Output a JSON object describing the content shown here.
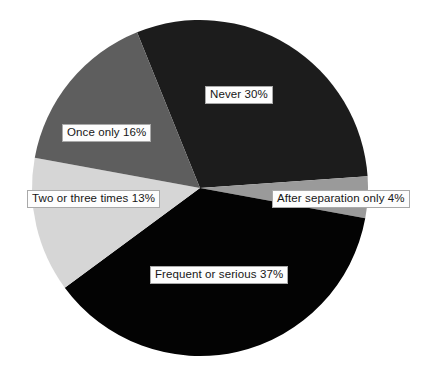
{
  "chart_data": {
    "type": "pie",
    "title": "",
    "subtitle": "",
    "xlabel": "",
    "ylabel": "",
    "legend_position": "none",
    "grid": false,
    "value_unit": "percent",
    "total": 100,
    "start_angle_deg": -22,
    "direction": "clockwise",
    "categories": [
      "Never",
      "After separation only",
      "Frequent or serious",
      "Two or three times",
      "Once only"
    ],
    "values": [
      30,
      4,
      37,
      13,
      16
    ],
    "labels": [
      "Never 30%",
      "After separation only 4%",
      "Frequent or serious 37%",
      "Two or three times 13%",
      "Once only 16%"
    ],
    "colors": [
      "#1c1c1c",
      "#9a9a9a",
      "#030303",
      "#d6d6d6",
      "#5e5e5e"
    ],
    "slices": [
      {
        "name": "Never",
        "label": "Never 30%",
        "value": 30,
        "color": "#1c1c1c",
        "start_deg": -22,
        "end_deg": 86
      },
      {
        "name": "After separation only",
        "label": "After separation only 4%",
        "value": 4,
        "color": "#9a9a9a",
        "start_deg": 86,
        "end_deg": 100.4
      },
      {
        "name": "Frequent or serious",
        "label": "Frequent or serious 37%",
        "value": 37,
        "color": "#030303",
        "start_deg": 100.4,
        "end_deg": 233.6
      },
      {
        "name": "Two or three times",
        "label": "Two or three times 13%",
        "value": 13,
        "color": "#d6d6d6",
        "start_deg": 233.6,
        "end_deg": 280.4
      },
      {
        "name": "Once only",
        "label": "Once only 16%",
        "value": 16,
        "color": "#5e5e5e",
        "start_deg": 280.4,
        "end_deg": 338
      }
    ],
    "geometry": {
      "center_x": 200,
      "center_y": 188,
      "radius": 168
    }
  },
  "canvas": {
    "background": "#ffffff",
    "width": 422,
    "height": 370
  }
}
